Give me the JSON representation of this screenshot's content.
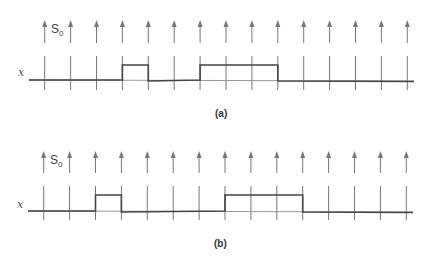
{
  "figure": {
    "panels": [
      {
        "id": "a",
        "caption": "(a)",
        "signal_label": "x",
        "sample_label": "S",
        "sample_subscript": "0",
        "pulses": [
          [
            3,
            4
          ],
          [
            6,
            9
          ]
        ]
      },
      {
        "id": "b",
        "caption": "(b)",
        "signal_label": "x",
        "sample_label": "S",
        "sample_subscript": "0",
        "pulses": [
          [
            2,
            3
          ],
          [
            7,
            10
          ]
        ]
      }
    ],
    "sample_count": 15,
    "colors": {
      "arrow": "#777777",
      "tick": "#777777",
      "signal": "#444444",
      "baseline_light": "#999999"
    }
  },
  "chart_data": {
    "type": "line",
    "panels": [
      {
        "caption": "(a)",
        "x": [
          0,
          1,
          2,
          3,
          4,
          5,
          6,
          7,
          8,
          9,
          10,
          11,
          12,
          13,
          14
        ],
        "values": [
          0,
          0,
          0,
          1,
          0,
          0,
          1,
          1,
          1,
          0,
          0,
          0,
          0,
          0,
          0
        ],
        "pulses_start_end_sample_index": [
          [
            3,
            4
          ],
          [
            6,
            9
          ]
        ]
      },
      {
        "caption": "(b)",
        "x": [
          0,
          1,
          2,
          3,
          4,
          5,
          6,
          7,
          8,
          9,
          10,
          11,
          12,
          13,
          14
        ],
        "values": [
          0,
          0,
          1,
          0,
          0,
          0,
          0,
          1,
          1,
          1,
          0,
          0,
          0,
          0,
          0
        ],
        "pulses_start_end_sample_index": [
          [
            2,
            3
          ],
          [
            7,
            10
          ]
        ]
      }
    ],
    "xlabel": "",
    "ylabel": "x",
    "annotations": [
      "S0"
    ]
  }
}
